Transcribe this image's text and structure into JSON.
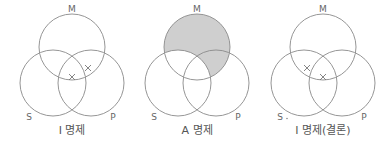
{
  "colors": {
    "background": "#ffffff",
    "stroke": "#8a8a8a",
    "shade": "#cfcfcf",
    "text": "#666666"
  },
  "geometry": {
    "radius": 33,
    "centers_relative": {
      "M": [
        72,
        47
      ],
      "S": [
        53,
        83
      ],
      "P": [
        91,
        83
      ]
    },
    "label_positions_relative": {
      "M": [
        72,
        12
      ],
      "S": [
        29,
        120
      ],
      "P": [
        113,
        120
      ]
    },
    "caption_y": 134
  },
  "panels": [
    {
      "id": "panel-i",
      "offset_x": 0,
      "labels": {
        "M": "M",
        "S": "S",
        "P": "P"
      },
      "caption": "I 명제",
      "shading": "none",
      "marks": [
        {
          "region": "M∩S∩P",
          "x": 72,
          "y": 77
        },
        {
          "region": "M∩P",
          "x": 88,
          "y": 68
        }
      ],
      "extra_dot": false
    },
    {
      "id": "panel-a",
      "offset_x": 125,
      "labels": {
        "M": "M",
        "S": "S",
        "P": "P"
      },
      "caption": "A 명제",
      "shading": "M-minus-S",
      "marks": [],
      "extra_dot": false
    },
    {
      "id": "panel-i-conclusion",
      "offset_x": 251,
      "labels": {
        "M": "M",
        "S": "S",
        "P": "P"
      },
      "caption": "I 명제(결론)",
      "shading": "none",
      "marks": [
        {
          "region": "M∩S",
          "x": 56,
          "y": 68
        },
        {
          "region": "M∩S∩P",
          "x": 72,
          "y": 77
        }
      ],
      "extra_dot": true
    }
  ]
}
